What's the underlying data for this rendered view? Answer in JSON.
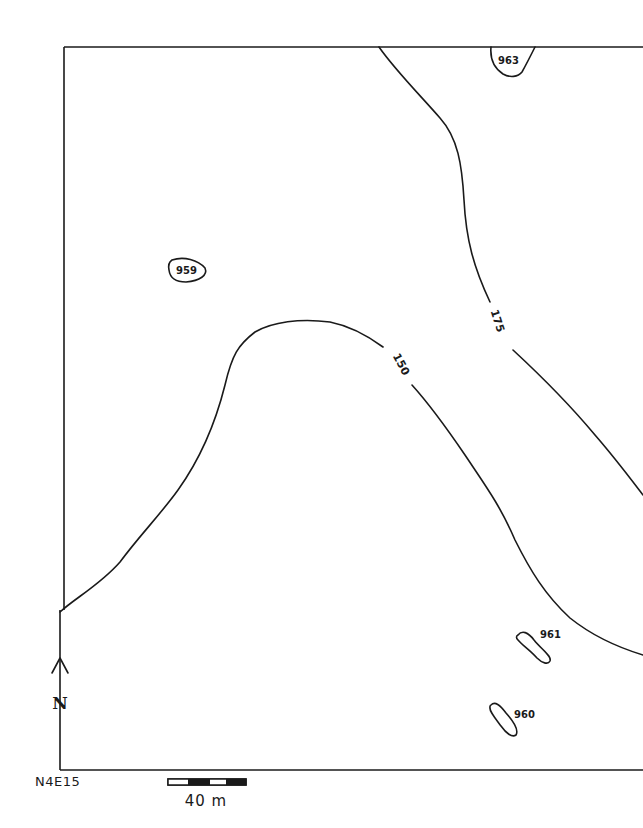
{
  "map": {
    "type": "topographic contour map",
    "frame_corner_label": "N4E15",
    "north_arrow": {
      "label": "N"
    },
    "scale_bar": {
      "label": "40 m",
      "segments": [
        "white",
        "black",
        "white",
        "black"
      ]
    },
    "contours": [
      {
        "id": "contour-150",
        "label": "150"
      },
      {
        "id": "contour-175",
        "label": "175"
      }
    ],
    "features": [
      {
        "id": "feature-963",
        "label": "963"
      },
      {
        "id": "feature-959",
        "label": "959"
      },
      {
        "id": "feature-961",
        "label": "961"
      },
      {
        "id": "feature-960",
        "label": "960"
      }
    ]
  }
}
